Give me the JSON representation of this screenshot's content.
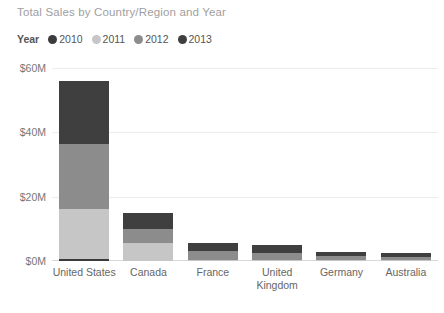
{
  "chart_data": {
    "type": "bar",
    "subtype": "stacked-column",
    "title": "Total Sales by Country/Region and Year",
    "xlabel": "",
    "ylabel": "",
    "ylim": [
      0,
      60
    ],
    "yticks": [
      0,
      20,
      40,
      60
    ],
    "ytick_labels": [
      "$0M",
      "$20M",
      "$40M",
      "$60M"
    ],
    "grid": true,
    "legend_title": "Year",
    "legend_position": "top-left",
    "value_unit": "M",
    "categories": [
      "United States",
      "Canada",
      "France",
      "United Kingdom",
      "Germany",
      "Australia"
    ],
    "series": [
      {
        "name": "2010",
        "color": "#3b3b3b",
        "values": [
          0.5,
          0.0,
          0.0,
          0.0,
          0.0,
          0.0
        ]
      },
      {
        "name": "2011",
        "color": "#c6c6c6",
        "values": [
          15.8,
          5.6,
          0.4,
          0.3,
          0.2,
          0.1
        ]
      },
      {
        "name": "2012",
        "color": "#8c8c8c",
        "values": [
          20.2,
          4.3,
          2.6,
          2.3,
          1.3,
          1.0
        ]
      },
      {
        "name": "2013",
        "color": "#3f3f3f",
        "values": [
          19.5,
          5.1,
          2.5,
          2.4,
          1.3,
          1.1
        ]
      }
    ],
    "totals": [
      56.0,
      15.0,
      5.5,
      5.0,
      2.8,
      2.2
    ]
  },
  "legend": {
    "title": "Year",
    "items": [
      {
        "label": "2010",
        "color": "#3b3b3b"
      },
      {
        "label": "2011",
        "color": "#c6c6c6"
      },
      {
        "label": "2012",
        "color": "#8c8c8c"
      },
      {
        "label": "2013",
        "color": "#3f3f3f"
      }
    ]
  },
  "colors": {
    "background": "#ffffff",
    "title_text": "#a0a0a0",
    "axis_text": "#666666",
    "gridline": "#ececec",
    "baseline": "#d8d8d8"
  }
}
